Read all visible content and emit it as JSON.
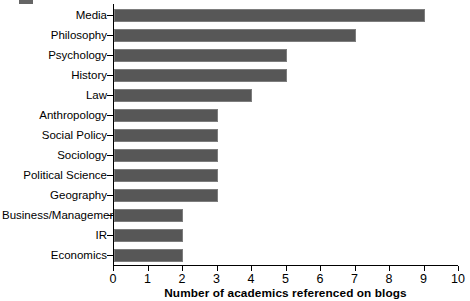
{
  "chart_data": {
    "type": "bar",
    "orientation": "horizontal",
    "title": "",
    "xlabel": "Number of academics referenced on blogs",
    "ylabel": "",
    "categories": [
      "Media",
      "Philosophy",
      "Psychology",
      "History",
      "Law",
      "Anthropology",
      "Social Policy",
      "Sociology",
      "Political Science",
      "Geography",
      "Business/Management",
      "IR",
      "Economics"
    ],
    "values": [
      9,
      7,
      5,
      5,
      4,
      3,
      3,
      3,
      3,
      3,
      2,
      2,
      2
    ],
    "xlim": [
      0,
      10
    ],
    "xticks": [
      0,
      1,
      2,
      3,
      4,
      5,
      6,
      7,
      8,
      9,
      10
    ],
    "xtick_labels": [
      "0",
      "1",
      "2",
      "3",
      "4",
      "5",
      "6",
      "7",
      "8",
      "9",
      "10"
    ],
    "grid": false,
    "legend": null,
    "bar_color": "#575757",
    "axis_color": "#000000",
    "background_color": "#ffffff"
  }
}
